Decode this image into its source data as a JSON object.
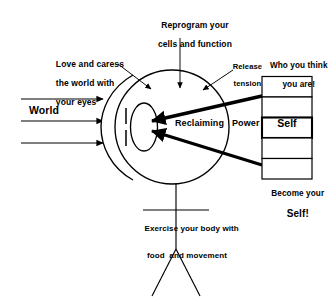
{
  "diagram": {
    "title": "Reclaiming Power",
    "colors": {
      "ink": "#000000",
      "background": "#ffffff"
    },
    "labels": {
      "reprogram_line1": "Reprogram your",
      "reprogram_line2": "cells and function",
      "love_line1": "Love and caress",
      "love_line2": "the world with",
      "love_line3": "your eyes",
      "release_line1": "Release",
      "release_line2": "tension",
      "who_line1": "Who you think",
      "who_line2": "you are!",
      "world": "World",
      "reclaiming": "Reclaiming",
      "power": "Power",
      "become_line1": "Become your",
      "become_line2": "Self!",
      "exercise_line1": "Exercise your body with",
      "exercise_line2": "food  and movement"
    },
    "ladder": {
      "cells": [
        "",
        "",
        "Self",
        "",
        ""
      ],
      "highlighted_index": 2,
      "highlighted_label": "Self"
    },
    "world_arrows": {
      "count": 3,
      "direction": "right",
      "label": "World"
    },
    "head_arrows": [
      {
        "name": "love-and-caress",
        "direction": "down-right"
      },
      {
        "name": "reprogram",
        "direction": "down"
      },
      {
        "name": "release-tension",
        "direction": "down-left"
      }
    ],
    "power_arrows": [
      {
        "name": "who-you-think-you-are",
        "direction": "left"
      },
      {
        "name": "become-your-self",
        "direction": "up-left"
      }
    ],
    "figure": {
      "parts": [
        "head",
        "cornea",
        "iris",
        "pupil-slit",
        "spine",
        "arms",
        "left-leg",
        "right-leg"
      ]
    }
  }
}
